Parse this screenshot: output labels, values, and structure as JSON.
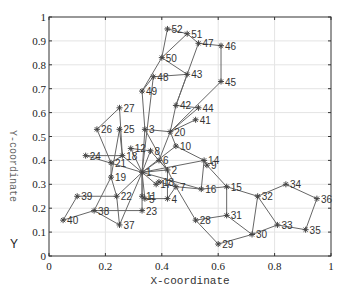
{
  "chart_data": {
    "type": "scatter",
    "title": "",
    "xlabel": "X-coordinate",
    "ylabel": "Y-coordinate",
    "y_axis_extra_label": "Y",
    "xlim": [
      0,
      1
    ],
    "ylim": [
      0,
      1
    ],
    "grid": true,
    "legend": null,
    "x_ticks": [
      "0",
      "0.2",
      "0.4",
      "0.6",
      "0.8",
      "1"
    ],
    "y_ticks": [
      "0",
      "0.1",
      "0.2",
      "0.3",
      "0.4",
      "0.5",
      "0.6",
      "0.7",
      "0.8",
      "0.9",
      "1"
    ],
    "marker": "asterisk",
    "colors": {
      "edge": "#666666",
      "marker": "#444444",
      "grid": "#e4e4e4",
      "frame": "#333333"
    },
    "nodes": [
      {
        "id": "1",
        "x": 0.33,
        "y": 0.35
      },
      {
        "id": "2",
        "x": 0.42,
        "y": 0.36
      },
      {
        "id": "3",
        "x": 0.34,
        "y": 0.53
      },
      {
        "id": "4",
        "x": 0.42,
        "y": 0.24
      },
      {
        "id": "5",
        "x": 0.34,
        "y": 0.24
      },
      {
        "id": "6",
        "x": 0.39,
        "y": 0.4
      },
      {
        "id": "7",
        "x": 0.45,
        "y": 0.29
      },
      {
        "id": "8",
        "x": 0.36,
        "y": 0.44
      },
      {
        "id": "9",
        "x": 0.56,
        "y": 0.38
      },
      {
        "id": "10",
        "x": 0.45,
        "y": 0.46
      },
      {
        "id": "11",
        "x": 0.33,
        "y": 0.25
      },
      {
        "id": "12",
        "x": 0.29,
        "y": 0.45
      },
      {
        "id": "13",
        "x": 0.39,
        "y": 0.31
      },
      {
        "id": "14",
        "x": 0.55,
        "y": 0.4
      },
      {
        "id": "15",
        "x": 0.63,
        "y": 0.29
      },
      {
        "id": "16",
        "x": 0.54,
        "y": 0.28
      },
      {
        "id": "17",
        "x": 0.38,
        "y": 0.3
      },
      {
        "id": "18",
        "x": 0.26,
        "y": 0.42
      },
      {
        "id": "19",
        "x": 0.22,
        "y": 0.33
      },
      {
        "id": "20",
        "x": 0.43,
        "y": 0.52
      },
      {
        "id": "21",
        "x": 0.22,
        "y": 0.39
      },
      {
        "id": "22",
        "x": 0.24,
        "y": 0.25
      },
      {
        "id": "23",
        "x": 0.33,
        "y": 0.19
      },
      {
        "id": "24",
        "x": 0.13,
        "y": 0.42
      },
      {
        "id": "25",
        "x": 0.25,
        "y": 0.53
      },
      {
        "id": "26",
        "x": 0.17,
        "y": 0.53
      },
      {
        "id": "27",
        "x": 0.25,
        "y": 0.62
      },
      {
        "id": "28",
        "x": 0.52,
        "y": 0.15
      },
      {
        "id": "29",
        "x": 0.6,
        "y": 0.05
      },
      {
        "id": "30",
        "x": 0.72,
        "y": 0.09
      },
      {
        "id": "31",
        "x": 0.63,
        "y": 0.17
      },
      {
        "id": "32",
        "x": 0.74,
        "y": 0.25
      },
      {
        "id": "33",
        "x": 0.81,
        "y": 0.13
      },
      {
        "id": "34",
        "x": 0.84,
        "y": 0.3
      },
      {
        "id": "35",
        "x": 0.91,
        "y": 0.11
      },
      {
        "id": "36",
        "x": 0.95,
        "y": 0.24
      },
      {
        "id": "37",
        "x": 0.25,
        "y": 0.13
      },
      {
        "id": "38",
        "x": 0.16,
        "y": 0.19
      },
      {
        "id": "39",
        "x": 0.1,
        "y": 0.25
      },
      {
        "id": "40",
        "x": 0.05,
        "y": 0.15
      },
      {
        "id": "41",
        "x": 0.52,
        "y": 0.57
      },
      {
        "id": "42",
        "x": 0.45,
        "y": 0.63
      },
      {
        "id": "43",
        "x": 0.49,
        "y": 0.76
      },
      {
        "id": "44",
        "x": 0.53,
        "y": 0.62
      },
      {
        "id": "45",
        "x": 0.61,
        "y": 0.73
      },
      {
        "id": "46",
        "x": 0.61,
        "y": 0.88
      },
      {
        "id": "47",
        "x": 0.53,
        "y": 0.89
      },
      {
        "id": "48",
        "x": 0.37,
        "y": 0.75
      },
      {
        "id": "49",
        "x": 0.33,
        "y": 0.69
      },
      {
        "id": "50",
        "x": 0.4,
        "y": 0.83
      },
      {
        "id": "51",
        "x": 0.49,
        "y": 0.93
      },
      {
        "id": "52",
        "x": 0.42,
        "y": 0.95
      }
    ],
    "edges": [
      [
        "52",
        "50"
      ],
      [
        "52",
        "51"
      ],
      [
        "51",
        "47"
      ],
      [
        "47",
        "46"
      ],
      [
        "46",
        "45"
      ],
      [
        "51",
        "50"
      ],
      [
        "50",
        "43"
      ],
      [
        "50",
        "49"
      ],
      [
        "48",
        "49"
      ],
      [
        "48",
        "43"
      ],
      [
        "47",
        "42"
      ],
      [
        "43",
        "42"
      ],
      [
        "45",
        "20"
      ],
      [
        "42",
        "44"
      ],
      [
        "42",
        "20"
      ],
      [
        "41",
        "20"
      ],
      [
        "44",
        "20"
      ],
      [
        "48",
        "1"
      ],
      [
        "49",
        "3"
      ],
      [
        "27",
        "26"
      ],
      [
        "27",
        "18"
      ],
      [
        "26",
        "21"
      ],
      [
        "25",
        "18"
      ],
      [
        "25",
        "19"
      ],
      [
        "3",
        "20"
      ],
      [
        "3",
        "1"
      ],
      [
        "20",
        "10"
      ],
      [
        "10",
        "1"
      ],
      [
        "10",
        "14"
      ],
      [
        "12",
        "8"
      ],
      [
        "8",
        "1"
      ],
      [
        "8",
        "2"
      ],
      [
        "6",
        "1"
      ],
      [
        "6",
        "2"
      ],
      [
        "24",
        "18"
      ],
      [
        "24",
        "1"
      ],
      [
        "18",
        "1"
      ],
      [
        "18",
        "21"
      ],
      [
        "21",
        "19"
      ],
      [
        "19",
        "22"
      ],
      [
        "19",
        "38"
      ],
      [
        "22",
        "1"
      ],
      [
        "22",
        "37"
      ],
      [
        "39",
        "22"
      ],
      [
        "39",
        "40"
      ],
      [
        "40",
        "38"
      ],
      [
        "38",
        "37"
      ],
      [
        "37",
        "1"
      ],
      [
        "38",
        "23"
      ],
      [
        "23",
        "1"
      ],
      [
        "1",
        "11"
      ],
      [
        "1",
        "5"
      ],
      [
        "1",
        "17"
      ],
      [
        "1",
        "2"
      ],
      [
        "1",
        "14"
      ],
      [
        "1",
        "16"
      ],
      [
        "2",
        "4"
      ],
      [
        "2",
        "7"
      ],
      [
        "4",
        "5"
      ],
      [
        "11",
        "5"
      ],
      [
        "7",
        "4"
      ],
      [
        "7",
        "16"
      ],
      [
        "13",
        "7"
      ],
      [
        "14",
        "9"
      ],
      [
        "14",
        "16"
      ],
      [
        "9",
        "15"
      ],
      [
        "15",
        "16"
      ],
      [
        "15",
        "31"
      ],
      [
        "15",
        "32"
      ],
      [
        "7",
        "28"
      ],
      [
        "28",
        "31"
      ],
      [
        "28",
        "29"
      ],
      [
        "29",
        "30"
      ],
      [
        "31",
        "30"
      ],
      [
        "30",
        "32"
      ],
      [
        "32",
        "33"
      ],
      [
        "32",
        "34"
      ],
      [
        "34",
        "36"
      ],
      [
        "36",
        "35"
      ],
      [
        "35",
        "33"
      ],
      [
        "30",
        "33"
      ],
      [
        "12",
        "1"
      ],
      [
        "3",
        "2"
      ],
      [
        "20",
        "6"
      ]
    ]
  }
}
